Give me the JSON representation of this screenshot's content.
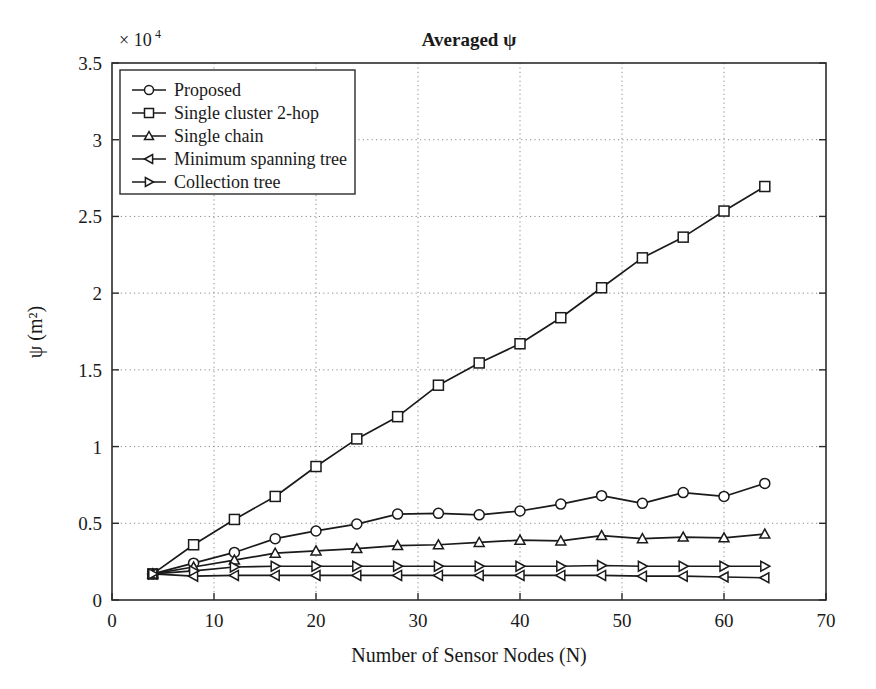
{
  "chart_data": {
    "type": "line",
    "title": "Averaged ψ",
    "xlabel": "Number of Sensor Nodes (N)",
    "ylabel": "ψ (m²)",
    "y_exponent_label": "× 10",
    "y_exponent_power": "4",
    "y_scale": 10000,
    "xlim": [
      0,
      70
    ],
    "ylim": [
      0,
      35000
    ],
    "xticks": [
      0,
      10,
      20,
      30,
      40,
      50,
      60,
      70
    ],
    "xticklabels": [
      "0",
      "10",
      "20",
      "30",
      "40",
      "50",
      "60",
      "70"
    ],
    "yticks": [
      0,
      5000,
      10000,
      15000,
      20000,
      25000,
      30000,
      35000
    ],
    "yticklabels": [
      "0",
      "0.5",
      "1",
      "1.5",
      "2",
      "2.5",
      "3",
      "3.5"
    ],
    "grid": true,
    "legend_position": "top-left",
    "x": [
      4,
      8,
      12,
      16,
      20,
      24,
      28,
      32,
      36,
      40,
      44,
      48,
      52,
      56,
      60,
      64
    ],
    "series": [
      {
        "name": "Proposed",
        "marker": "circle",
        "values": [
          1700,
          2400,
          3100,
          4000,
          4500,
          4950,
          5600,
          5650,
          5550,
          5800,
          6250,
          6800,
          6300,
          7000,
          6750,
          7600
        ]
      },
      {
        "name": "Single cluster 2-hop",
        "marker": "square",
        "values": [
          1700,
          3600,
          5250,
          6750,
          8700,
          10500,
          11950,
          14000,
          15450,
          16700,
          18400,
          20350,
          22300,
          23650,
          25350,
          26950
        ]
      },
      {
        "name": "Single chain",
        "marker": "triangle-up",
        "values": [
          1700,
          2150,
          2600,
          3050,
          3200,
          3350,
          3550,
          3600,
          3750,
          3900,
          3850,
          4200,
          4000,
          4100,
          4050,
          4300
        ]
      },
      {
        "name": "Minimum spanning tree",
        "marker": "triangle-left",
        "values": [
          1700,
          1550,
          1600,
          1600,
          1600,
          1600,
          1600,
          1600,
          1600,
          1600,
          1600,
          1600,
          1550,
          1550,
          1500,
          1450
        ]
      },
      {
        "name": "Collection tree",
        "marker": "triangle-right",
        "values": [
          1700,
          1900,
          2150,
          2200,
          2200,
          2200,
          2200,
          2200,
          2200,
          2200,
          2200,
          2250,
          2200,
          2200,
          2200,
          2200
        ]
      }
    ]
  }
}
